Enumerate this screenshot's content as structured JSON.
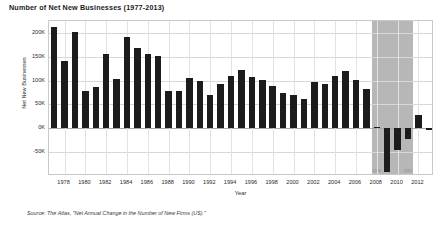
{
  "chart_data": {
    "type": "bar",
    "title": "Number of Net New Businesses (1977-2013)",
    "xlabel": "Year",
    "ylabel": "Net New Businesses",
    "ylim": [
      -100000,
      225000
    ],
    "ytick_labels": [
      "200K",
      "150K",
      "100K",
      "50K",
      "0K",
      "-50K"
    ],
    "ytick_values": [
      200000,
      150000,
      100000,
      50000,
      0,
      -50000
    ],
    "xtick_labels": [
      "1978",
      "1980",
      "1982",
      "1984",
      "1986",
      "1988",
      "1990",
      "1992",
      "1994",
      "1996",
      "1998",
      "2000",
      "2002",
      "2004",
      "2006",
      "2008",
      "2010",
      "2012"
    ],
    "grid": true,
    "legend": "none",
    "bar_color": "#1c1c1c",
    "shade_color": "#b7b7b7",
    "categories": [
      1977,
      1978,
      1979,
      1980,
      1981,
      1982,
      1983,
      1984,
      1985,
      1986,
      1987,
      1988,
      1989,
      1990,
      1991,
      1992,
      1993,
      1994,
      1995,
      1996,
      1997,
      1998,
      1999,
      2000,
      2001,
      2002,
      2003,
      2004,
      2005,
      2006,
      2007,
      2008,
      2009,
      2010,
      2011,
      2012,
      2013
    ],
    "values": [
      212000,
      142000,
      202000,
      79000,
      87000,
      156000,
      103000,
      191000,
      169000,
      155000,
      152000,
      78000,
      79000,
      105000,
      100000,
      70000,
      93000,
      110000,
      122000,
      108000,
      102000,
      88000,
      75000,
      70000,
      62000,
      98000,
      92000,
      109000,
      121000,
      101000,
      83000,
      3000,
      -92000,
      -45000,
      -22000,
      28000,
      -4000
    ],
    "shaded_region": {
      "start_year": 2008,
      "end_year": 2011,
      "start_label": "2008",
      "end_label": "2011"
    }
  },
  "footer": {
    "source": "Source: The Atlas, \"Net Annual Change in the Number of New Firms (US).\""
  }
}
